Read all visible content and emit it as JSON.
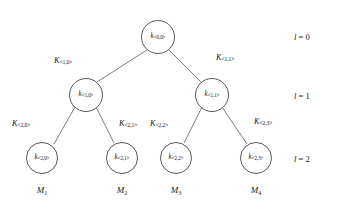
{
  "figure": {
    "type": "binary-key-tree-diagram",
    "background_color": "#ffffff",
    "stroke_color": "#5a5a5a",
    "text_color": "#1a1a1a"
  },
  "nodes": [
    {
      "id": "n-0-0",
      "base": "k",
      "index": "<0,0>",
      "level": 0,
      "cx": 158,
      "cy": 37,
      "r": 17
    },
    {
      "id": "n-1-0",
      "base": "k",
      "index": "<1,0>",
      "level": 1,
      "cx": 86,
      "cy": 95,
      "r": 17
    },
    {
      "id": "n-1-1",
      "base": "k",
      "index": "<1,1>",
      "level": 1,
      "cx": 212,
      "cy": 95,
      "r": 17
    },
    {
      "id": "n-2-0",
      "base": "k",
      "index": "<2,0>",
      "level": 2,
      "cx": 42,
      "cy": 158,
      "r": 16
    },
    {
      "id": "n-2-1",
      "base": "k",
      "index": "<2,1>",
      "level": 2,
      "cx": 122,
      "cy": 158,
      "r": 16
    },
    {
      "id": "n-2-2",
      "base": "k",
      "index": "<2,2>",
      "level": 2,
      "cx": 176,
      "cy": 158,
      "r": 16
    },
    {
      "id": "n-2-3",
      "base": "k",
      "index": "<2,3>",
      "level": 2,
      "cx": 256,
      "cy": 158,
      "r": 16
    }
  ],
  "edges": [
    {
      "id": "e-root-left",
      "from": "n-0-0",
      "to": "n-1-0",
      "x1": 147,
      "y1": 50,
      "x2": 97,
      "y2": 82
    },
    {
      "id": "e-root-right",
      "from": "n-0-0",
      "to": "n-1-1",
      "x1": 169,
      "y1": 50,
      "x2": 201,
      "y2": 82
    },
    {
      "id": "e-l0-left",
      "from": "n-1-0",
      "to": "n-2-0",
      "x1": 75,
      "y1": 107,
      "x2": 54,
      "y2": 144
    },
    {
      "id": "e-l0-right",
      "from": "n-1-0",
      "to": "n-2-1",
      "x1": 96,
      "y1": 107,
      "x2": 114,
      "y2": 143
    },
    {
      "id": "e-l1-left",
      "from": "n-1-1",
      "to": "n-2-2",
      "x1": 202,
      "y1": 107,
      "x2": 184,
      "y2": 143
    },
    {
      "id": "e-l1-right",
      "from": "n-1-1",
      "to": "n-2-3",
      "x1": 222,
      "y1": 107,
      "x2": 247,
      "y2": 144
    }
  ],
  "edge_labels": [
    {
      "id": "kl-1-0",
      "base": "K",
      "index": "<1,0>",
      "x": 54,
      "y": 57
    },
    {
      "id": "kl-1-1",
      "base": "K",
      "index": "<1,1>",
      "x": 216,
      "y": 54
    },
    {
      "id": "kl-2-0",
      "base": "K",
      "index": "<2,0>",
      "x": 12,
      "y": 120
    },
    {
      "id": "kl-2-1",
      "base": "K",
      "index": "<2,1>",
      "x": 119,
      "y": 120
    },
    {
      "id": "kl-2-2",
      "base": "K",
      "index": "<2,2>",
      "x": 150,
      "y": 120
    },
    {
      "id": "kl-2-3",
      "base": "K",
      "index": "<2,3>",
      "x": 254,
      "y": 118
    }
  ],
  "leaf_captions": [
    {
      "id": "m-1",
      "base": "M",
      "index": "1",
      "x": 42,
      "y": 186
    },
    {
      "id": "m-2",
      "base": "M",
      "index": "2",
      "x": 122,
      "y": 186
    },
    {
      "id": "m-3",
      "base": "M",
      "index": "3",
      "x": 176,
      "y": 186
    },
    {
      "id": "m-4",
      "base": "M",
      "index": "4",
      "x": 256,
      "y": 186
    }
  ],
  "level_labels": [
    {
      "id": "level-0",
      "symbol": "l",
      "equals": " = ",
      "value": "0",
      "x": 294,
      "y": 33
    },
    {
      "id": "level-1",
      "symbol": "l",
      "equals": " = ",
      "value": "1",
      "x": 294,
      "y": 92
    },
    {
      "id": "level-2",
      "symbol": "l",
      "equals": " = ",
      "value": "2",
      "x": 294,
      "y": 155
    }
  ]
}
